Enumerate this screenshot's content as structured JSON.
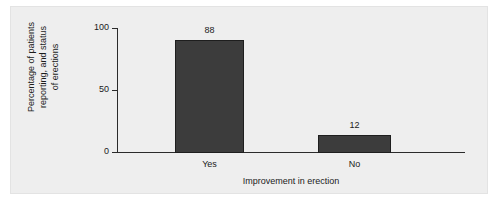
{
  "chart_data": {
    "type": "bar",
    "title": "",
    "categories": [
      "Yes",
      "No"
    ],
    "values": [
      88,
      12
    ],
    "value_labels": [
      "88",
      "12"
    ],
    "xlabel": "Improvement in erection",
    "ylabel": "Percentage of patients reporting, and status of erections",
    "ylabel_lines": [
      "Percentage of patients",
      "reporting, and status",
      "of erections"
    ],
    "ylim": [
      0,
      100
    ],
    "yticks": [
      0,
      50,
      100
    ],
    "ytick_labels": [
      "0",
      "50",
      "100"
    ],
    "grid": false,
    "legend": false,
    "colors": {
      "bar_fill": "#3c3c3c",
      "bar_edge": "#1e1e1e",
      "background": "#eeeeee",
      "axis": "#2b2b2b",
      "text": "#1b1b1b"
    }
  },
  "axes": {
    "y_tick_100": "100",
    "y_tick_50": "50",
    "y_tick_0": "0"
  }
}
